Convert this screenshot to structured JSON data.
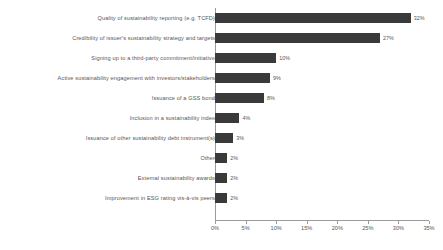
{
  "chart_data": {
    "type": "bar",
    "orientation": "horizontal",
    "title": "",
    "subtitle": "",
    "xlabel": "",
    "ylabel": "",
    "xlim": [
      0,
      35
    ],
    "grid": false,
    "legend": false,
    "bar_color": "#3a3a3a",
    "text_color": "#555555",
    "axis_color": "#9a9a9a",
    "tick_labels": [
      "0%",
      "5%",
      "10%",
      "15%",
      "20%",
      "25%",
      "30%",
      "35%"
    ],
    "tick_values": [
      0,
      5,
      10,
      15,
      20,
      25,
      30,
      35
    ],
    "categories": [
      "Quality of sustainability reporting (e.g. TCFD)",
      "Credibility of issuer's sustainability strategy and targets",
      "Signing up to a third-party commitment/initiative",
      "Active sustainability engagement with investors/stakeholders",
      "Issuance of a GSS  bond",
      "Inclusion in a sustainability index",
      "Issuance of other sustainability debt instrument(s)",
      "Other",
      "External sustainability awards",
      "Improvement in ESG rating vis-à-vis peers"
    ],
    "values": [
      32,
      27,
      10,
      9,
      8,
      4,
      3,
      2,
      2,
      2
    ],
    "data_labels": [
      "32%",
      "27%",
      "10%",
      "9%",
      "8%",
      "4%",
      "3%",
      "2%",
      "2%",
      "2%"
    ]
  }
}
